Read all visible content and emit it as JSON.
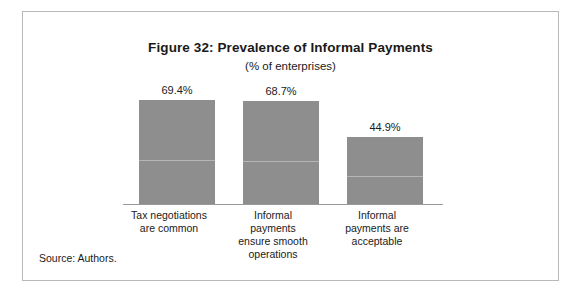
{
  "figure": {
    "source_note": "Source: Authors."
  },
  "chart_data": {
    "type": "bar",
    "title": "Figure 32: Prevalence of Informal Payments",
    "subtitle": "(% of enterprises)",
    "xlabel": "",
    "ylabel": "",
    "ylim": [
      0,
      80
    ],
    "grid": false,
    "legend": "none",
    "bar_color": "#8e8e8e",
    "categories": [
      "Tax negotiations are common",
      "Informal payments ensure smooth operations",
      "Informal payments are acceptable"
    ],
    "category_lines": [
      [
        "Tax negotiations",
        "are common"
      ],
      [
        "Informal",
        "payments",
        "ensure smooth",
        "operations"
      ],
      [
        "Informal",
        "payments are",
        "acceptable"
      ]
    ],
    "values": [
      69.4,
      68.7,
      44.9
    ],
    "value_labels": [
      "69.4%",
      "68.7%",
      "44.9%"
    ]
  }
}
